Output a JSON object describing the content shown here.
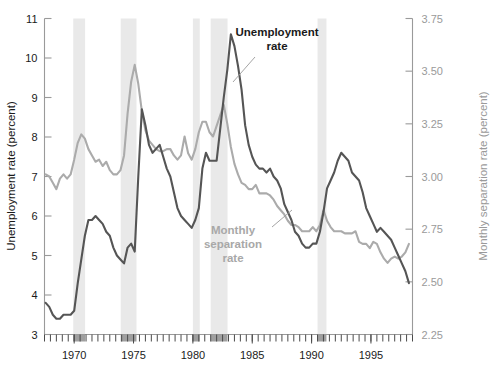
{
  "chart_data": {
    "type": "line",
    "title": "",
    "xlabel": "",
    "ylabel": "Unemployment rate (percent)",
    "y2label": "Monthly separation rate (percent)",
    "xlim": [
      1967.5,
      1998.5
    ],
    "ylim": [
      3,
      11
    ],
    "y2lim": [
      2.25,
      3.75
    ],
    "grid": false,
    "legend_position": "inline-annotations",
    "xticks": [
      1970,
      1975,
      1980,
      1985,
      1990,
      1995
    ],
    "xtick_labels": [
      "1970",
      "1975",
      "1980",
      "1985",
      "1990",
      "1995"
    ],
    "xtick_minor_interval": 0.5,
    "yticks": [
      3,
      4,
      5,
      6,
      7,
      8,
      9,
      10,
      11
    ],
    "ytick_labels": [
      "3",
      "4",
      "5",
      "6",
      "7",
      "8",
      "9",
      "10",
      "11"
    ],
    "y2ticks": [
      2.25,
      2.5,
      2.75,
      3.0,
      3.25,
      3.5,
      3.75
    ],
    "y2tick_labels": [
      "2.25",
      "2.50",
      "2.75",
      "3.00",
      "3.25",
      "3.50",
      "3.75"
    ],
    "annotations": [
      {
        "name": "unemployment-rate",
        "text": "Unemployment\nrate",
        "color": "#1a1a1a"
      },
      {
        "name": "monthly-separation-rate",
        "text": "Monthly\nseparation\nrate",
        "color": "#a8a8a8"
      }
    ],
    "shaded_regions_label": "recession bands",
    "shaded_regions": [
      {
        "start": 1969.92,
        "end": 1970.92
      },
      {
        "start": 1973.92,
        "end": 1975.25
      },
      {
        "start": 1980.0,
        "end": 1980.58
      },
      {
        "start": 1981.5,
        "end": 1982.92
      },
      {
        "start": 1990.5,
        "end": 1991.25
      }
    ],
    "series": [
      {
        "name": "Unemployment rate",
        "axis": "left",
        "color": "#555555",
        "x": [
          1967.6,
          1967.9,
          1968.2,
          1968.5,
          1968.8,
          1969.1,
          1969.4,
          1969.7,
          1970.0,
          1970.3,
          1970.6,
          1970.9,
          1971.2,
          1971.5,
          1971.8,
          1972.1,
          1972.4,
          1972.7,
          1973.0,
          1973.3,
          1973.6,
          1973.9,
          1974.2,
          1974.5,
          1974.8,
          1975.1,
          1975.4,
          1975.7,
          1976.0,
          1976.3,
          1976.6,
          1976.9,
          1977.2,
          1977.5,
          1977.8,
          1978.1,
          1978.4,
          1978.7,
          1979.0,
          1979.3,
          1979.6,
          1979.9,
          1980.2,
          1980.5,
          1980.8,
          1981.1,
          1981.4,
          1981.7,
          1982.0,
          1982.3,
          1982.6,
          1982.9,
          1983.2,
          1983.5,
          1983.8,
          1984.1,
          1984.4,
          1984.7,
          1985.0,
          1985.3,
          1985.6,
          1985.9,
          1986.2,
          1986.5,
          1986.8,
          1987.1,
          1987.4,
          1987.7,
          1988.0,
          1988.3,
          1988.6,
          1988.9,
          1989.2,
          1989.5,
          1989.8,
          1990.1,
          1990.4,
          1990.7,
          1991.0,
          1991.3,
          1991.6,
          1991.9,
          1992.2,
          1992.5,
          1992.8,
          1993.1,
          1993.4,
          1993.7,
          1994.0,
          1994.3,
          1994.6,
          1994.9,
          1995.2,
          1995.5,
          1995.8,
          1996.1,
          1996.4,
          1996.7,
          1997.0,
          1997.3,
          1997.6,
          1997.9,
          1998.2
        ],
        "y": [
          3.8,
          3.7,
          3.5,
          3.4,
          3.4,
          3.5,
          3.5,
          3.5,
          3.6,
          4.3,
          4.9,
          5.5,
          5.9,
          5.9,
          6.0,
          5.9,
          5.8,
          5.6,
          5.5,
          5.2,
          5.0,
          4.9,
          4.8,
          5.2,
          5.3,
          5.1,
          7.0,
          8.7,
          8.3,
          7.8,
          7.6,
          7.7,
          7.8,
          7.5,
          7.2,
          7.0,
          6.6,
          6.2,
          6.0,
          5.9,
          5.8,
          5.7,
          5.9,
          6.2,
          7.2,
          7.6,
          7.4,
          7.4,
          7.4,
          8.2,
          9.0,
          9.7,
          10.6,
          10.3,
          9.8,
          9.2,
          8.3,
          7.8,
          7.5,
          7.3,
          7.2,
          7.2,
          7.1,
          7.2,
          7.0,
          6.9,
          6.7,
          6.3,
          6.1,
          5.9,
          5.6,
          5.5,
          5.3,
          5.2,
          5.2,
          5.3,
          5.3,
          5.6,
          6.1,
          6.7,
          6.9,
          7.1,
          7.4,
          7.6,
          7.5,
          7.4,
          7.1,
          7.0,
          6.9,
          6.6,
          6.2,
          6.0,
          5.8,
          5.6,
          5.7,
          5.6,
          5.5,
          5.4,
          5.2,
          5.0,
          4.8,
          4.6,
          4.3
        ]
      },
      {
        "name": "Monthly separation rate",
        "axis": "right",
        "color": "#ababab",
        "x": [
          1967.6,
          1967.9,
          1968.2,
          1968.5,
          1968.8,
          1969.1,
          1969.4,
          1969.7,
          1970.0,
          1970.3,
          1970.6,
          1970.9,
          1971.2,
          1971.5,
          1971.8,
          1972.1,
          1972.4,
          1972.7,
          1973.0,
          1973.3,
          1973.6,
          1973.9,
          1974.2,
          1974.5,
          1974.8,
          1975.1,
          1975.4,
          1975.7,
          1976.0,
          1976.3,
          1976.6,
          1976.9,
          1977.2,
          1977.5,
          1977.8,
          1978.1,
          1978.4,
          1978.7,
          1979.0,
          1979.3,
          1979.6,
          1979.9,
          1980.2,
          1980.5,
          1980.8,
          1981.1,
          1981.4,
          1981.7,
          1982.0,
          1982.3,
          1982.6,
          1982.9,
          1983.2,
          1983.5,
          1983.8,
          1984.1,
          1984.4,
          1984.7,
          1985.0,
          1985.3,
          1985.6,
          1985.9,
          1986.2,
          1986.5,
          1986.8,
          1987.1,
          1987.4,
          1987.7,
          1988.0,
          1988.3,
          1988.6,
          1988.9,
          1989.2,
          1989.5,
          1989.8,
          1990.1,
          1990.4,
          1990.7,
          1991.0,
          1991.3,
          1991.6,
          1991.9,
          1992.2,
          1992.5,
          1992.8,
          1993.1,
          1993.4,
          1993.7,
          1994.0,
          1994.3,
          1994.6,
          1994.9,
          1995.2,
          1995.5,
          1995.8,
          1996.1,
          1996.4,
          1996.7,
          1997.0,
          1997.3,
          1997.6,
          1997.9,
          1998.2
        ],
        "y_left_equiv": [
          7.3,
          7.2,
          7.0,
          6.8,
          7.1,
          7.2,
          7.1,
          7.2,
          7.6,
          8.1,
          8.3,
          8.2,
          7.9,
          7.7,
          7.5,
          7.6,
          7.4,
          7.5,
          7.3,
          7.2,
          7.2,
          7.3,
          7.7,
          8.8,
          9.6,
          10.0,
          9.5,
          8.8,
          8.3,
          8.0,
          7.9,
          7.8,
          7.7,
          7.7,
          7.8,
          7.8,
          7.6,
          7.5,
          7.6,
          8.1,
          7.7,
          7.5,
          7.8,
          8.3,
          8.6,
          8.6,
          8.3,
          8.2,
          8.5,
          8.8,
          9.1,
          8.6,
          8.0,
          7.5,
          7.2,
          7.0,
          6.9,
          6.8,
          6.8,
          6.9,
          6.7,
          6.7,
          6.7,
          6.6,
          6.5,
          6.3,
          6.2,
          6.1,
          5.9,
          5.8,
          5.8,
          5.7,
          5.6,
          5.6,
          5.6,
          5.7,
          5.6,
          5.8,
          6.2,
          5.9,
          5.7,
          5.6,
          5.6,
          5.6,
          5.5,
          5.5,
          5.5,
          5.6,
          5.3,
          5.2,
          5.2,
          5.1,
          5.3,
          5.2,
          5.0,
          4.8,
          4.7,
          4.8,
          4.9,
          4.8,
          4.9,
          5.0,
          5.2
        ],
        "y": [
          3.01,
          3.0,
          2.97,
          2.94,
          2.99,
          3.01,
          2.99,
          3.01,
          3.08,
          3.16,
          3.2,
          3.18,
          3.13,
          3.1,
          3.07,
          3.08,
          3.05,
          3.07,
          3.03,
          3.01,
          3.01,
          3.03,
          3.1,
          3.3,
          3.45,
          3.53,
          3.44,
          3.31,
          3.22,
          3.17,
          3.15,
          3.13,
          3.12,
          3.12,
          3.13,
          3.13,
          3.1,
          3.08,
          3.1,
          3.19,
          3.11,
          3.08,
          3.13,
          3.21,
          3.26,
          3.26,
          3.21,
          3.19,
          3.24,
          3.29,
          3.34,
          3.25,
          3.14,
          3.06,
          3.01,
          2.97,
          2.96,
          2.94,
          2.94,
          2.96,
          2.92,
          2.92,
          2.92,
          2.91,
          2.89,
          2.86,
          2.84,
          2.82,
          2.79,
          2.77,
          2.77,
          2.76,
          2.74,
          2.74,
          2.74,
          2.76,
          2.74,
          2.77,
          2.84,
          2.79,
          2.76,
          2.74,
          2.74,
          2.74,
          2.73,
          2.73,
          2.73,
          2.74,
          2.69,
          2.68,
          2.68,
          2.66,
          2.69,
          2.68,
          2.64,
          2.61,
          2.59,
          2.61,
          2.62,
          2.61,
          2.62,
          2.64,
          2.68
        ]
      }
    ]
  }
}
